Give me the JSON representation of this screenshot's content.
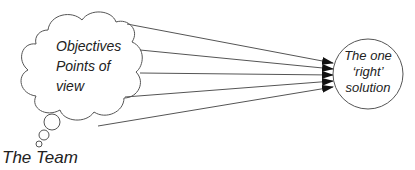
{
  "cloud": {
    "lines": [
      "Objectives",
      "Points of",
      "view"
    ]
  },
  "circle": {
    "lines": [
      "The one",
      "‘right’",
      "solution"
    ]
  },
  "team_label": "The Team",
  "colors": {
    "stroke": "#555555",
    "arrow": "#111111",
    "text": "#222222"
  }
}
